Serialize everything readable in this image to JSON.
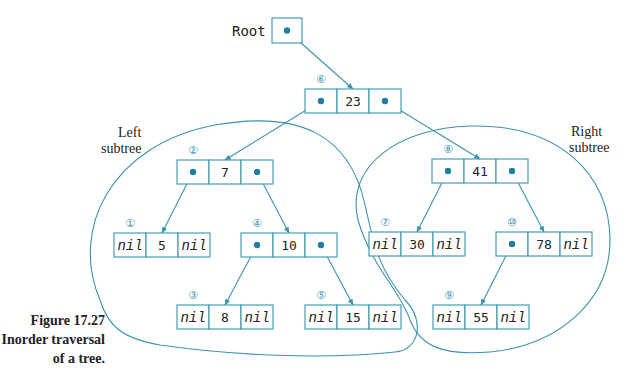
{
  "figure": {
    "number": "Figure 17.27",
    "caption_line1": "Inorder traversal",
    "caption_line2": "of a tree."
  },
  "labels": {
    "root": "Root",
    "left_subtree_1": "Left",
    "left_subtree_2": "subtree",
    "right_subtree_1": "Right",
    "right_subtree_2": "subtree"
  },
  "colors": {
    "line": "#3a93b0",
    "dot": "#1d7fa2",
    "text": "#222222"
  },
  "root_pointer": {
    "x": 272,
    "y": 18,
    "w": 30,
    "h": 25
  },
  "nodes": [
    {
      "id": "n23",
      "value": "23",
      "order": "⑥",
      "x": 305,
      "y": 89,
      "left": "ptr",
      "right": "ptr"
    },
    {
      "id": "n7",
      "value": "7",
      "order": "②",
      "x": 177,
      "y": 160,
      "left": "ptr",
      "right": "ptr"
    },
    {
      "id": "n41",
      "value": "41",
      "order": "⑧",
      "x": 432,
      "y": 159,
      "left": "ptr",
      "right": "ptr"
    },
    {
      "id": "n5",
      "value": "5",
      "order": "①",
      "x": 114,
      "y": 233,
      "left": "nil",
      "right": "nil"
    },
    {
      "id": "n10",
      "value": "10",
      "order": "④",
      "x": 241,
      "y": 233,
      "left": "ptr",
      "right": "ptr"
    },
    {
      "id": "n30",
      "value": "30",
      "order": "⑦",
      "x": 369,
      "y": 232,
      "left": "nil",
      "right": "nil"
    },
    {
      "id": "n78",
      "value": "78",
      "order": "⑩",
      "x": 496,
      "y": 232,
      "left": "ptr",
      "right": "nil"
    },
    {
      "id": "n8",
      "value": "8",
      "order": "③",
      "x": 177,
      "y": 305,
      "left": "nil",
      "right": "nil"
    },
    {
      "id": "n15",
      "value": "15",
      "order": "⑤",
      "x": 305,
      "y": 305,
      "left": "nil",
      "right": "nil"
    },
    {
      "id": "n55",
      "value": "55",
      "order": "⑨",
      "x": 433,
      "y": 305,
      "left": "nil",
      "right": "nil"
    }
  ],
  "edges": [
    {
      "from": "root",
      "to": "n23"
    },
    {
      "from": "n23",
      "side": "left",
      "to": "n7"
    },
    {
      "from": "n23",
      "side": "right",
      "to": "n41"
    },
    {
      "from": "n7",
      "side": "left",
      "to": "n5"
    },
    {
      "from": "n7",
      "side": "right",
      "to": "n10"
    },
    {
      "from": "n10",
      "side": "left",
      "to": "n8"
    },
    {
      "from": "n10",
      "side": "right",
      "to": "n15"
    },
    {
      "from": "n41",
      "side": "left",
      "to": "n30"
    },
    {
      "from": "n41",
      "side": "right",
      "to": "n78"
    },
    {
      "from": "n78",
      "side": "left",
      "to": "n55"
    }
  ],
  "nil_text": "nil"
}
